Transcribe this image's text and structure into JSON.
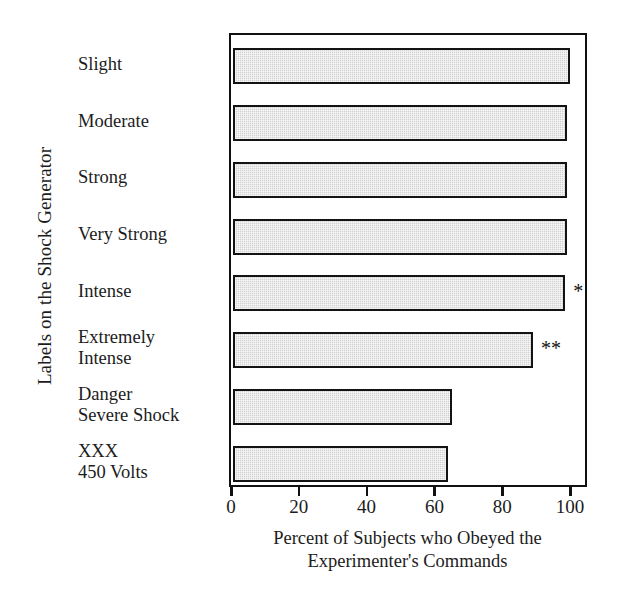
{
  "chart_data": {
    "type": "bar",
    "orientation": "horizontal",
    "title": "",
    "xlabel": "Percent of Subjects who Obeyed the Experimenter's Commands",
    "ylabel": "Labels on the Shock Generator",
    "categories": [
      "Slight",
      "Moderate",
      "Strong",
      "Very Strong",
      "Intense",
      "Extremely\nIntense",
      "Danger\nSevere Shock",
      "XXX\n450 Volts"
    ],
    "values": [
      99.5,
      98.5,
      98.5,
      98.5,
      98.0,
      88.5,
      64.5,
      63.5
    ],
    "annotations": [
      {
        "category": "Intense",
        "text": "*"
      },
      {
        "category": "Extremely\nIntense",
        "text": "**"
      }
    ],
    "xlim": [
      0,
      100
    ],
    "xticks": [
      0,
      20,
      40,
      60,
      80,
      100
    ],
    "xtick_labels": [
      "0",
      "20",
      "40",
      "60",
      "80",
      "100"
    ],
    "grid": false,
    "legend": "none",
    "bar_fill_color": "#d2d2d2",
    "bar_edge_color": "#131313",
    "frame_color": "#111111"
  },
  "axis": {
    "x_title_line1": "Percent of Subjects who Obeyed the",
    "x_title_line2": "Experimenter's Commands",
    "y_title": "Labels on the Shock Generator"
  }
}
